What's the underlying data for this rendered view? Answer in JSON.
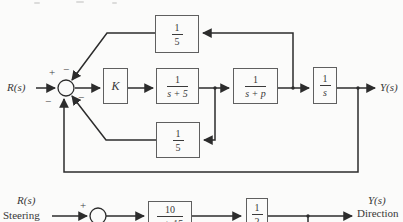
{
  "colors": {
    "wire": "#2c2c2c",
    "border": "#5f5f5f",
    "background": "#fbfbfa"
  },
  "diagram_top": {
    "input_label": "R(s)",
    "output_label": "Y(s)",
    "sum": {
      "plus": "+",
      "minus_top": "−",
      "minus_bottom_left": "−",
      "minus_bottom_right": "−"
    },
    "blocks": {
      "gain": {
        "label": "K"
      },
      "g1": {
        "num": "1",
        "den": "s + 5"
      },
      "g2": {
        "num": "1",
        "den": "s + p"
      },
      "g3": {
        "num": "1",
        "den": "s"
      },
      "feedback_top": {
        "num": "1",
        "den": "5"
      },
      "feedback_bottom": {
        "num": "1",
        "den": "5"
      }
    }
  },
  "diagram_bottom": {
    "input_label": "R(s)",
    "input_sublabel": "Steering",
    "output_label": "Y(s)",
    "output_sublabel": "Direction",
    "sum": {
      "plus": "+"
    },
    "blocks": {
      "g1": {
        "num": "10",
        "den": "s + 15"
      },
      "g2": {
        "num": "1",
        "den": "2"
      }
    }
  }
}
